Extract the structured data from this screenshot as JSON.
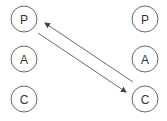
{
  "diagram": {
    "left_column": [
      {
        "label": "P"
      },
      {
        "label": "A"
      },
      {
        "label": "C"
      }
    ],
    "right_column": [
      {
        "label": "P"
      },
      {
        "label": "A"
      },
      {
        "label": "C"
      }
    ],
    "arrows": [
      {
        "from": "left.P",
        "to": "right.C"
      },
      {
        "from": "right.C",
        "to": "left.P"
      }
    ],
    "colors": {
      "stroke": "#555555",
      "text": "#333333",
      "background": "#ffffff"
    }
  }
}
